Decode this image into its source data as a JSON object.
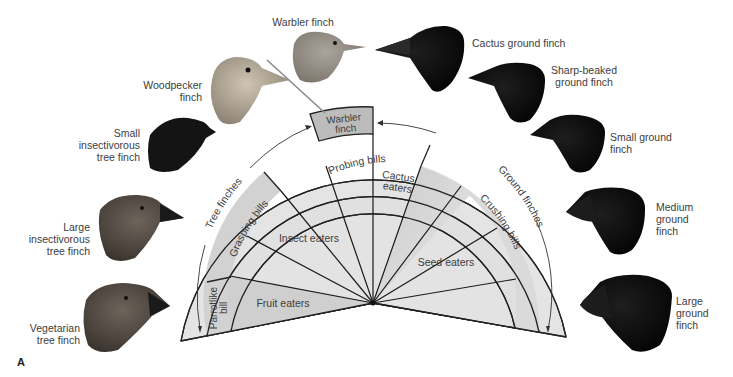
{
  "figure": {
    "panel_letter": "A",
    "colors": {
      "band_light": "#e6e6e6",
      "band_mid": "#d4d4d4",
      "warbler_box": "#bdbdbd",
      "lines": "#222222",
      "text": "#3d3d3d",
      "ground_finch_head": "#0c0c0c",
      "tree_finch_head": "#5a5048"
    }
  },
  "birds": {
    "warbler_finch": "Warbler finch",
    "woodpecker_finch": "Woodpecker finch",
    "small_insectivorous_tree_finch": "Small insectivorous tree finch",
    "large_insectivorous_tree_finch": "Large insectivorous tree finch",
    "vegetarian_tree_finch": "Vegetarian tree finch",
    "cactus_ground_finch": "Cactus ground finch",
    "sharp_beaked_ground_finch": "Sharp-beaked ground finch",
    "small_ground_finch": "Small ground finch",
    "medium_ground_finch": "Medium ground finch",
    "large_ground_finch": "Large ground finch"
  },
  "bird_label_lines": {
    "woodpecker": [
      "Woodpecker",
      "finch"
    ],
    "small_insect": [
      "Small",
      "insectivorous",
      "tree finch"
    ],
    "large_insect": [
      "Large",
      "insectivorous",
      "tree finch"
    ],
    "vegetarian": [
      "Vegetarian",
      "tree finch"
    ],
    "sharp_beaked": [
      "Sharp-beaked",
      "ground finch"
    ],
    "small_ground": [
      "Small ground",
      "finch"
    ],
    "medium_ground": [
      "Medium",
      "ground",
      "finch"
    ],
    "large_ground": [
      "Large",
      "ground",
      "finch"
    ]
  },
  "diagram": {
    "outer_band": {
      "tree_finches": "Tree finches",
      "warbler_finch_line1": "Warbler",
      "warbler_finch_line2": "finch",
      "ground_finches": "Ground finches"
    },
    "bill_band": {
      "grasping_bills": "Grasping bills",
      "probing_bills": "Probing bills",
      "crushing_bills": "Crushing bills",
      "parrotlike_bill_line1": "Parrotlike",
      "parrotlike_bill_line2": "bill"
    },
    "diet_wedges": {
      "fruit_eaters": "Fruit eaters",
      "insect_eaters": "Insect eaters",
      "cactus_eaters_line1": "Cactus",
      "cactus_eaters_line2": "eaters",
      "seed_eaters": "Seed eaters"
    }
  }
}
